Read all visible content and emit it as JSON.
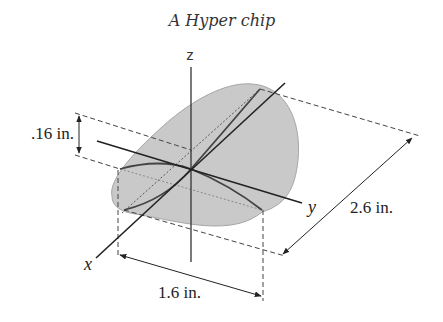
{
  "title": "A Hyper chip",
  "axes": {
    "x_label": "x",
    "y_label": "y",
    "z_label": "z"
  },
  "dimensions": {
    "thickness": ".16 in.",
    "length": "2.6 in.",
    "width": "1.6 in."
  },
  "colors": {
    "chip_fill": "#c8c8c8",
    "chip_edge": "#a8a8a8",
    "line": "#333333",
    "dashed": "#555555"
  }
}
